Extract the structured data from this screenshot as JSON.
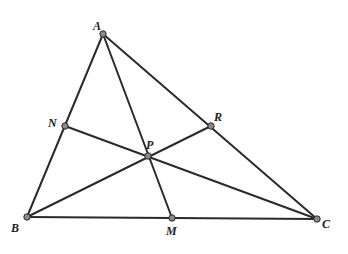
{
  "diagram": {
    "colors": {
      "line": "#2a2a2a",
      "point_fill": "#8a8a8a",
      "label": "#222222",
      "background": "#ffffff"
    },
    "points": [
      {
        "id": "A",
        "label": "A",
        "x": 103,
        "y": 34,
        "lx": 93,
        "ly": 30
      },
      {
        "id": "B",
        "label": "B",
        "x": 27,
        "y": 217,
        "lx": 11,
        "ly": 232
      },
      {
        "id": "C",
        "label": "C",
        "x": 317,
        "y": 219,
        "lx": 322,
        "ly": 228
      },
      {
        "id": "N",
        "label": "N",
        "x": 65,
        "y": 126,
        "lx": 48,
        "ly": 127
      },
      {
        "id": "P",
        "label": "P",
        "x": 148,
        "y": 156,
        "lx": 146,
        "ly": 149
      },
      {
        "id": "R",
        "label": "R",
        "x": 211,
        "y": 126,
        "lx": 214,
        "ly": 121
      },
      {
        "id": "M",
        "label": "M",
        "x": 172,
        "y": 218,
        "lx": 166,
        "ly": 235
      }
    ],
    "segments": [
      {
        "from": "A",
        "to": "B"
      },
      {
        "from": "B",
        "to": "C"
      },
      {
        "from": "C",
        "to": "A"
      },
      {
        "from": "A",
        "to": "M"
      },
      {
        "from": "B",
        "to": "R"
      },
      {
        "from": "C",
        "to": "N"
      }
    ]
  }
}
